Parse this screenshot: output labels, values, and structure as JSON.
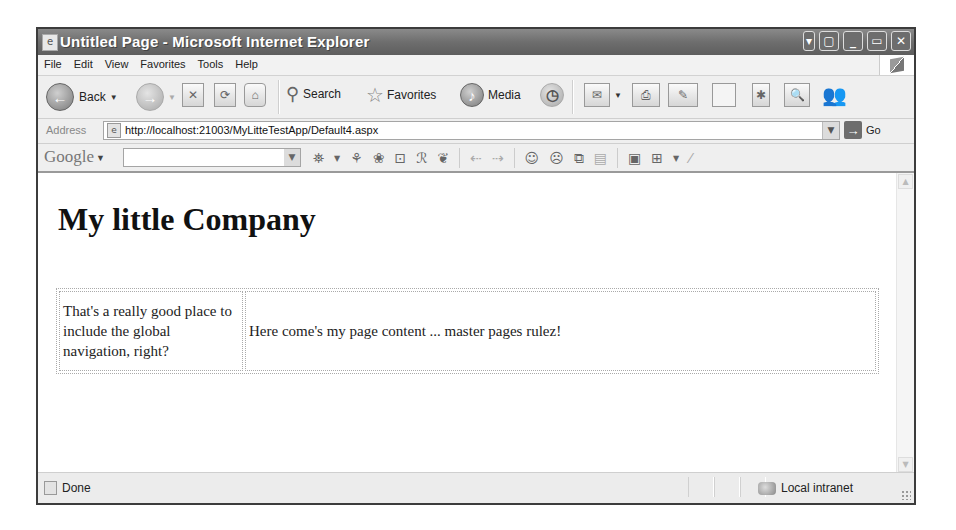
{
  "window": {
    "title": "Untitled Page - Microsoft Internet Explorer",
    "controls": [
      "menu",
      "restore-extra",
      "minimize",
      "maximize",
      "close"
    ]
  },
  "menubar": {
    "items": [
      {
        "label": "File",
        "accel": "F"
      },
      {
        "label": "Edit",
        "accel": "E"
      },
      {
        "label": "View",
        "accel": "V"
      },
      {
        "label": "Favorites",
        "accel": "a"
      },
      {
        "label": "Tools",
        "accel": "T"
      },
      {
        "label": "Help",
        "accel": "H"
      }
    ]
  },
  "toolbar": {
    "back_label": "Back",
    "search_label": "Search",
    "favorites_label": "Favorites",
    "media_label": "Media",
    "icons": [
      "back-icon",
      "forward-icon",
      "stop-icon",
      "refresh-icon",
      "home-icon",
      "search-icon",
      "favorites-icon",
      "media-icon",
      "history-icon",
      "mail-icon",
      "print-icon",
      "edit-icon",
      "discuss-icon",
      "research-icon",
      "messenger-icon"
    ]
  },
  "address": {
    "label": "Address",
    "url": "http://localhost:21003/MyLitteTestApp/Default4.aspx",
    "go_label": "Go"
  },
  "google_toolbar": {
    "logo": "Google",
    "search_value": "",
    "icons": [
      "binoculars-icon",
      "news-icon",
      "paw-icon",
      "popup-blocker-icon",
      "spellcheck-icon",
      "translate-icon",
      "back-arrow-icon",
      "forward-arrow-icon",
      "happy-face-icon",
      "sad-face-icon",
      "window-icon",
      "notes-icon",
      "image-icon",
      "folder-icon",
      "highlighter-icon"
    ]
  },
  "page": {
    "heading": "My little Company",
    "nav_text": "That's a really good place to include the global navigation, right?",
    "content_text": "Here come's my page content ... master pages rulez!"
  },
  "statusbar": {
    "status": "Done",
    "zone": "Local intranet"
  }
}
